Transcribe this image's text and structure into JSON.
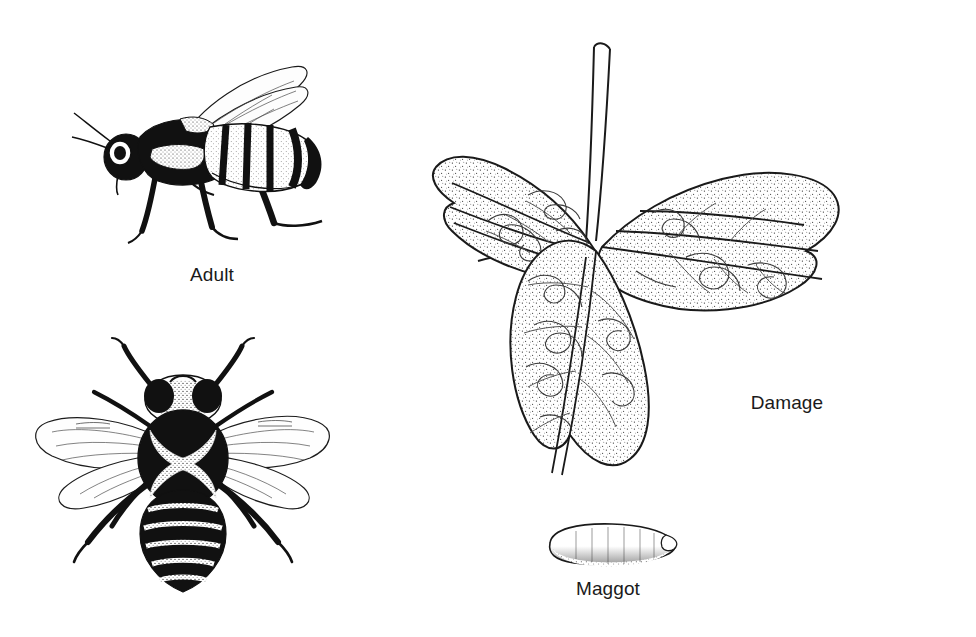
{
  "figure": {
    "medium": "black-and-white pen-and-ink line drawing with stipple shading",
    "background_color": "#ffffff",
    "ink_color": "#111111",
    "width": 976,
    "height": 637
  },
  "labels": {
    "adult": "Adult",
    "damage": "Damage",
    "maggot": "Maggot"
  },
  "panels": [
    {
      "id": "adult-lateral",
      "label": "Adult",
      "view": "lateral side view of adult fly",
      "features": "black and pale-stippled thorax, vertically banded abdomen, two translucent veined wings swept back, dark legs, bristled head with antenna"
    },
    {
      "id": "adult-dorsal",
      "label": "Adult",
      "view": "dorsal top view of adult fly",
      "features": "black oval thorax bearing a pale X-shaped hourglass mark, abdomen with five pale cross bands tapering to a point, two outspread veined wings, six dark legs, paired dark compound eyes"
    },
    {
      "id": "damage",
      "label": "Damage",
      "view": "trifoliate leaf with leafminer injury",
      "features": "three stippled leaflets with serrated margins radiating from a central node with short petiole, pale serpentine mine tunnels winding across the blades"
    },
    {
      "id": "maggot",
      "label": "Maggot",
      "view": "larva",
      "features": "small elongated pale capsule-shaped grub, tapered pointed posterior end, stipple shading along the underside"
    }
  ]
}
